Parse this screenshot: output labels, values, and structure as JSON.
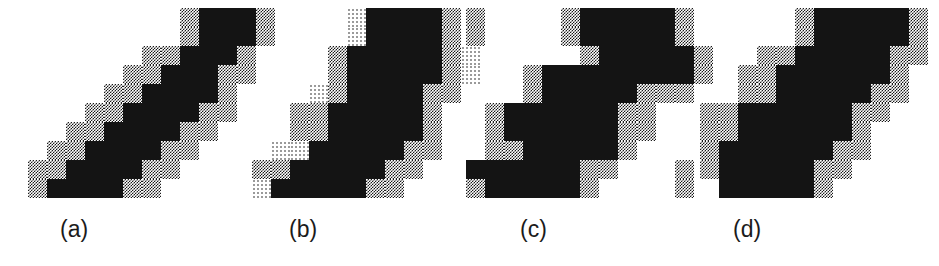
{
  "figure": {
    "kind": "raster-line-dither-figure",
    "width": 939,
    "height": 266,
    "background_color": "#ffffff",
    "ink_color": "#141414",
    "dither_dense_color": "#1a1a1a",
    "dither_sparse_color": "#9a9a9a",
    "cell_size": 19,
    "caption_font_size": 23,
    "legend": {
      "0": "white / empty pixel",
      "1": "dense 50% checkerboard dithered pixel",
      "2": "sparse light dithered pixel",
      "3": "solid black pixel"
    },
    "panels": [
      {
        "id": "a",
        "label": "(a)",
        "label_x": 60,
        "label_y": 218,
        "origin_x": 28,
        "origin_y": 8,
        "cols": 13,
        "rows": 10,
        "grid": [
          [
            0,
            0,
            0,
            0,
            0,
            0,
            0,
            0,
            1,
            3,
            3,
            3,
            1
          ],
          [
            0,
            0,
            0,
            0,
            0,
            0,
            0,
            0,
            1,
            3,
            3,
            3,
            1
          ],
          [
            0,
            0,
            0,
            0,
            0,
            0,
            1,
            1,
            3,
            3,
            3,
            1,
            0
          ],
          [
            0,
            0,
            0,
            0,
            0,
            1,
            1,
            3,
            3,
            3,
            1,
            1,
            0
          ],
          [
            0,
            0,
            0,
            0,
            1,
            1,
            3,
            3,
            3,
            3,
            1,
            0,
            0
          ],
          [
            0,
            0,
            0,
            1,
            1,
            3,
            3,
            3,
            3,
            1,
            1,
            0,
            0
          ],
          [
            0,
            0,
            1,
            1,
            3,
            3,
            3,
            3,
            1,
            1,
            0,
            0,
            0
          ],
          [
            0,
            1,
            1,
            3,
            3,
            3,
            3,
            1,
            1,
            0,
            0,
            0,
            0
          ],
          [
            1,
            1,
            3,
            3,
            3,
            3,
            1,
            1,
            0,
            0,
            0,
            0,
            0
          ],
          [
            1,
            3,
            3,
            3,
            3,
            1,
            1,
            0,
            0,
            0,
            0,
            0,
            0
          ]
        ]
      },
      {
        "id": "b",
        "label": "(b)",
        "label_x": 289,
        "label_y": 218,
        "origin_x": 252,
        "origin_y": 8,
        "cols": 12,
        "rows": 10,
        "grid": [
          [
            0,
            0,
            0,
            0,
            0,
            2,
            3,
            3,
            3,
            3,
            1,
            0
          ],
          [
            0,
            0,
            0,
            0,
            0,
            2,
            3,
            3,
            3,
            3,
            1,
            0
          ],
          [
            0,
            0,
            0,
            0,
            1,
            3,
            3,
            3,
            3,
            3,
            1,
            2
          ],
          [
            0,
            0,
            0,
            0,
            1,
            3,
            3,
            3,
            3,
            3,
            1,
            2
          ],
          [
            0,
            0,
            0,
            2,
            1,
            3,
            3,
            3,
            3,
            1,
            1,
            0
          ],
          [
            0,
            0,
            1,
            1,
            3,
            3,
            3,
            3,
            3,
            1,
            0,
            0
          ],
          [
            0,
            0,
            1,
            1,
            3,
            3,
            3,
            3,
            3,
            1,
            0,
            0
          ],
          [
            0,
            2,
            2,
            3,
            3,
            3,
            3,
            3,
            1,
            1,
            0,
            0
          ],
          [
            1,
            1,
            3,
            3,
            3,
            3,
            3,
            1,
            1,
            0,
            0,
            0
          ],
          [
            2,
            3,
            3,
            3,
            3,
            3,
            1,
            1,
            0,
            0,
            0,
            0
          ]
        ]
      },
      {
        "id": "c",
        "label": "(c)",
        "label_x": 520,
        "label_y": 218,
        "origin_x": 466,
        "origin_y": 8,
        "cols": 13,
        "rows": 10,
        "grid": [
          [
            1,
            0,
            0,
            0,
            0,
            1,
            3,
            3,
            3,
            3,
            3,
            1,
            0
          ],
          [
            1,
            0,
            0,
            0,
            0,
            1,
            3,
            3,
            3,
            3,
            3,
            1,
            0
          ],
          [
            0,
            0,
            0,
            0,
            0,
            0,
            1,
            3,
            3,
            3,
            3,
            3,
            1
          ],
          [
            0,
            0,
            0,
            1,
            3,
            3,
            3,
            3,
            3,
            3,
            3,
            3,
            1
          ],
          [
            0,
            0,
            0,
            1,
            3,
            3,
            3,
            3,
            3,
            1,
            1,
            1,
            0
          ],
          [
            0,
            1,
            3,
            3,
            3,
            3,
            3,
            3,
            1,
            1,
            0,
            0,
            0
          ],
          [
            0,
            1,
            3,
            3,
            3,
            3,
            3,
            3,
            1,
            1,
            0,
            0,
            0
          ],
          [
            0,
            1,
            1,
            3,
            3,
            3,
            3,
            3,
            1,
            0,
            0,
            0,
            0
          ],
          [
            3,
            3,
            3,
            3,
            3,
            3,
            1,
            1,
            0,
            0,
            0,
            1,
            0
          ],
          [
            1,
            3,
            3,
            3,
            3,
            3,
            1,
            0,
            0,
            0,
            0,
            1,
            0
          ]
        ]
      },
      {
        "id": "d",
        "label": "(d)",
        "label_x": 733,
        "label_y": 218,
        "origin_x": 700,
        "origin_y": 8,
        "cols": 12,
        "rows": 10,
        "grid": [
          [
            0,
            0,
            0,
            0,
            0,
            1,
            3,
            3,
            3,
            3,
            3,
            1
          ],
          [
            0,
            0,
            0,
            0,
            0,
            1,
            3,
            3,
            3,
            3,
            3,
            1
          ],
          [
            0,
            0,
            0,
            1,
            1,
            3,
            3,
            3,
            3,
            3,
            1,
            1
          ],
          [
            0,
            0,
            1,
            1,
            3,
            3,
            3,
            3,
            3,
            3,
            1,
            0
          ],
          [
            0,
            0,
            1,
            1,
            3,
            3,
            3,
            3,
            3,
            1,
            1,
            0
          ],
          [
            1,
            1,
            3,
            3,
            3,
            3,
            3,
            3,
            1,
            1,
            0,
            0
          ],
          [
            1,
            1,
            3,
            3,
            3,
            3,
            3,
            3,
            1,
            0,
            0,
            0
          ],
          [
            1,
            3,
            3,
            3,
            3,
            3,
            3,
            1,
            1,
            0,
            0,
            0
          ],
          [
            1,
            3,
            3,
            3,
            3,
            3,
            1,
            1,
            0,
            0,
            0,
            0
          ],
          [
            0,
            3,
            3,
            3,
            3,
            3,
            1,
            0,
            0,
            0,
            0,
            0
          ]
        ]
      }
    ]
  }
}
